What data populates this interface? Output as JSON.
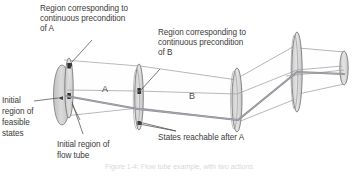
{
  "figure": {
    "type": "technical-diagram",
    "background_color": "#ffffff",
    "stroke_color": "#6e6e6e",
    "trajectory_color": "#7b7b82",
    "ellipse_fill": "#cfcfcf",
    "text_color": "#3b3b3b"
  },
  "annotations": {
    "precondition_a": "Region corresponding to\ncontinuous precondition\nof A",
    "precondition_a_line1": "Region corresponding to",
    "precondition_a_line2": "continuous precondition",
    "precondition_a_line3": "of A",
    "precondition_b_line1": "Region corresponding to",
    "precondition_b_line2": "continuous precondition",
    "precondition_b_line3": "of B",
    "initial_feasible_line1": "Initial",
    "initial_feasible_line2": "region of",
    "initial_feasible_line3": "feasible",
    "initial_feasible_line4": "states",
    "initial_flowtube_line1": "Initial region of",
    "initial_flowtube_line2": "flow tube",
    "states_reachable": "States reachable after A"
  },
  "tube_labels": {
    "action_a": "A",
    "action_b": "B"
  },
  "caption": {
    "partial_text": "Figure 1-4: Flow tube example, with two actions"
  }
}
